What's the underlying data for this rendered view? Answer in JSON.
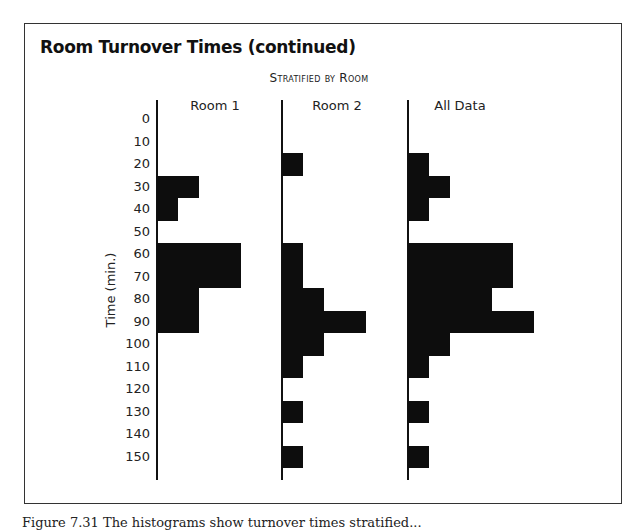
{
  "figure": {
    "title": "Room Turnover Times (continued)",
    "subtitle": "Stratified by Room",
    "ylabel": "Time (min.)",
    "caption": "Figure 7.31 The histograms show turnover times stratified..."
  },
  "chart_data": {
    "type": "bar",
    "orientation": "horizontal",
    "title": "Room Turnover Times (continued)",
    "subtitle": "Stratified by Room",
    "xlabel": "",
    "ylabel": "Time (min.)",
    "categories": [
      "0",
      "10",
      "20",
      "30",
      "40",
      "50",
      "60",
      "70",
      "80",
      "90",
      "100",
      "110",
      "120",
      "130",
      "140",
      "150"
    ],
    "series": [
      {
        "name": "Room 1",
        "values": [
          0,
          0,
          0,
          2,
          1,
          0,
          4,
          4,
          2,
          2,
          0,
          0,
          0,
          0,
          0,
          0
        ]
      },
      {
        "name": "Room 2",
        "values": [
          0,
          0,
          1,
          0,
          0,
          0,
          1,
          1,
          2,
          4,
          2,
          1,
          0,
          1,
          0,
          1
        ]
      },
      {
        "name": "All Data",
        "values": [
          0,
          0,
          1,
          2,
          1,
          0,
          5,
          5,
          4,
          6,
          2,
          1,
          0,
          1,
          0,
          1
        ]
      }
    ],
    "grid": false,
    "legend": "none (panel headers)"
  },
  "layout": {
    "bar_color": "#0d0d0d",
    "unit_px": 21,
    "row_px": 22.5,
    "first_row_top": 108,
    "panel_axes_x": [
      156,
      281,
      407
    ]
  }
}
